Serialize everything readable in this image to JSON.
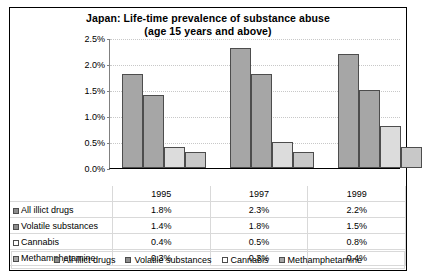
{
  "chart_data": {
    "type": "bar",
    "title": "Japan:  Life-time prevalence of substance abuse",
    "subtitle": "(age 15 years and above)",
    "xlabel": "",
    "ylabel": "",
    "ylim": [
      0,
      2.5
    ],
    "ytick_labels": [
      "0.0%",
      "0.5%",
      "1.0%",
      "1.5%",
      "2.0%",
      "2.5%"
    ],
    "ytick_values": [
      0.0,
      0.5,
      1.0,
      1.5,
      2.0,
      2.5
    ],
    "grid": true,
    "legend_position": "bottom",
    "categories": [
      "1995",
      "1997",
      "1999"
    ],
    "series": [
      {
        "name": "All illict drugs",
        "values": [
          1.8,
          2.3,
          2.2
        ],
        "labels": [
          "1.8%",
          "2.3%",
          "2.2%"
        ]
      },
      {
        "name": "Volatile  substances",
        "values": [
          1.4,
          1.8,
          1.5
        ],
        "labels": [
          "1.4%",
          "1.8%",
          "1.5%"
        ]
      },
      {
        "name": "Cannabis",
        "values": [
          0.4,
          0.5,
          0.8
        ],
        "labels": [
          "0.4%",
          "0.5%",
          "0.8%"
        ]
      },
      {
        "name": "Methamphetamine",
        "values": [
          0.3,
          0.3,
          0.4
        ],
        "labels": [
          "0.3%",
          "0.3%",
          "0.4%"
        ]
      }
    ],
    "colors": [
      "#a6a6a6",
      "#a6a6a6",
      "#dcdcdc",
      "#c8c8c8"
    ]
  },
  "legend": {
    "items": [
      "All illict drugs",
      "Volatile substances",
      "Cannabis",
      "Methamphetamine"
    ]
  },
  "table": {
    "year_headers": [
      "1995",
      "1997",
      "1999"
    ],
    "rows": [
      {
        "label": "All illict drugs",
        "values": [
          "1.8%",
          "2.3%",
          "2.2%"
        ]
      },
      {
        "label": "Volatile  substances",
        "values": [
          "1.4%",
          "1.8%",
          "1.5%"
        ]
      },
      {
        "label": "Cannabis",
        "values": [
          "0.4%",
          "0.5%",
          "0.8%"
        ]
      },
      {
        "label": "Methamphetamine",
        "values": [
          "0.3%",
          "0.3%",
          "0.4%"
        ]
      }
    ]
  }
}
